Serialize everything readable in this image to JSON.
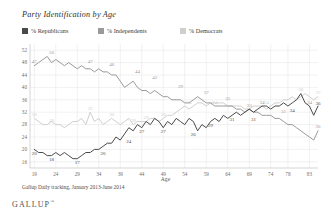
{
  "chart_data": {
    "type": "line",
    "title": "Party Identification by Age",
    "xlabel": "Age",
    "ylabel": "",
    "source_note": "Gallup Daily tracking, January 2013-June 2014",
    "brand": "GALLUP",
    "brand_mark": "™",
    "grid": true,
    "legend_position": "top",
    "xlim": [
      18,
      85
    ],
    "ylim": [
      14,
      54
    ],
    "yticks": [
      52,
      48,
      44,
      40,
      36,
      32,
      28,
      24,
      20,
      16
    ],
    "xticks": [
      19,
      24,
      29,
      34,
      39,
      44,
      49,
      54,
      59,
      64,
      69,
      74,
      78,
      83
    ],
    "colors": {
      "republicans": "#4a4a4a",
      "independents": "#9a9a9a",
      "democrats": "#cfcfcf",
      "grid": "#e2e2e2",
      "axis": "#b8b8b8"
    },
    "series": [
      {
        "name": "% Republicans",
        "color": "#4a4a4a",
        "x": [
          19,
          20,
          21,
          22,
          23,
          24,
          25,
          26,
          27,
          28,
          29,
          30,
          31,
          32,
          33,
          34,
          35,
          36,
          37,
          38,
          39,
          40,
          41,
          42,
          43,
          44,
          45,
          46,
          47,
          48,
          49,
          50,
          51,
          52,
          53,
          54,
          55,
          56,
          57,
          58,
          59,
          60,
          61,
          62,
          63,
          64,
          65,
          66,
          67,
          68,
          69,
          70,
          71,
          72,
          73,
          74,
          75,
          76,
          77,
          78,
          79,
          80,
          81,
          82,
          83,
          84,
          85
        ],
        "values": [
          20,
          19,
          19,
          18,
          18,
          19,
          18,
          19,
          18,
          17,
          17,
          18,
          19,
          19,
          20,
          20,
          21,
          22,
          22,
          24,
          23,
          25,
          27,
          26,
          28,
          27,
          29,
          28,
          30,
          29,
          27,
          29,
          28,
          30,
          29,
          28,
          30,
          29,
          26,
          28,
          27,
          29,
          30,
          29,
          31,
          30,
          31,
          32,
          31,
          32,
          33,
          32,
          33,
          34,
          34,
          33,
          34,
          34,
          35,
          34,
          35,
          36,
          38,
          35,
          34,
          31,
          34
        ]
      },
      {
        "name": "% Independents",
        "color": "#9a9a9a",
        "x": [
          19,
          20,
          21,
          22,
          23,
          24,
          25,
          26,
          27,
          28,
          29,
          30,
          31,
          32,
          33,
          34,
          35,
          36,
          37,
          38,
          39,
          40,
          41,
          42,
          43,
          44,
          45,
          46,
          47,
          48,
          49,
          50,
          51,
          52,
          53,
          54,
          55,
          56,
          57,
          58,
          59,
          60,
          61,
          62,
          63,
          64,
          65,
          66,
          67,
          68,
          69,
          70,
          71,
          72,
          73,
          74,
          75,
          76,
          77,
          78,
          79,
          80,
          81,
          82,
          83,
          84,
          85
        ],
        "values": [
          47,
          48,
          49,
          50,
          48,
          49,
          48,
          47,
          48,
          47,
          46,
          47,
          46,
          46,
          45,
          46,
          45,
          45,
          44,
          44,
          42,
          40,
          41,
          42,
          40,
          39,
          39,
          38,
          39,
          38,
          37,
          37,
          36,
          36,
          36,
          35,
          35,
          36,
          37,
          36,
          35,
          35,
          34,
          34,
          34,
          34,
          34,
          33,
          33,
          32,
          33,
          32,
          32,
          31,
          31,
          31,
          30,
          30,
          29,
          28,
          28,
          27,
          26,
          25,
          24,
          23,
          26
        ]
      },
      {
        "name": "% Democrats",
        "color": "#cfcfcf",
        "x": [
          19,
          20,
          21,
          22,
          23,
          24,
          25,
          26,
          27,
          28,
          29,
          30,
          31,
          32,
          33,
          34,
          35,
          36,
          37,
          38,
          39,
          40,
          41,
          42,
          43,
          44,
          45,
          46,
          47,
          48,
          49,
          50,
          51,
          52,
          53,
          54,
          55,
          56,
          57,
          58,
          59,
          60,
          61,
          62,
          63,
          64,
          65,
          66,
          67,
          68,
          69,
          70,
          71,
          72,
          73,
          74,
          75,
          76,
          77,
          78,
          79,
          80,
          81,
          82,
          83,
          84,
          85
        ],
        "values": [
          30,
          29,
          28,
          28,
          29,
          28,
          28,
          27,
          28,
          29,
          29,
          30,
          28,
          32,
          29,
          30,
          28,
          29,
          30,
          29,
          28,
          29,
          30,
          28,
          29,
          29,
          29,
          30,
          30,
          29,
          30,
          31,
          31,
          32,
          33,
          34,
          33,
          34,
          35,
          35,
          34,
          35,
          35,
          35,
          35,
          34,
          34,
          34,
          34,
          33,
          33,
          34,
          34,
          34,
          33,
          34,
          35,
          35,
          36,
          36,
          37,
          36,
          37,
          38,
          37,
          36,
          37
        ]
      }
    ],
    "annotations": [
      {
        "series": "independents",
        "x": 19,
        "y": 47,
        "text": "47"
      },
      {
        "series": "independents",
        "x": 23,
        "y": 50,
        "text": "50"
      },
      {
        "series": "independents",
        "x": 32,
        "y": 47,
        "text": "47"
      },
      {
        "series": "independents",
        "x": 37,
        "y": 46,
        "text": "46"
      },
      {
        "series": "independents",
        "x": 43,
        "y": 44,
        "text": "44"
      },
      {
        "series": "independents",
        "x": 47,
        "y": 42,
        "text": "42"
      },
      {
        "series": "independents",
        "x": 53,
        "y": 39,
        "text": "39"
      },
      {
        "series": "independents",
        "x": 59,
        "y": 37,
        "text": "37"
      },
      {
        "series": "independents",
        "x": 64,
        "y": 35,
        "text": "35"
      },
      {
        "series": "independents",
        "x": 69,
        "y": 33,
        "text": "33"
      },
      {
        "series": "independents",
        "x": 72,
        "y": 34,
        "text": "34"
      },
      {
        "series": "independents",
        "x": 77,
        "y": 31,
        "text": "31"
      },
      {
        "series": "independents",
        "x": 83,
        "y": 34,
        "text": "34"
      },
      {
        "series": "independents",
        "x": 85,
        "y": 26,
        "text": "26"
      },
      {
        "series": "democrats",
        "x": 19,
        "y": 30,
        "text": "30"
      },
      {
        "series": "democrats",
        "x": 23,
        "y": 28,
        "text": "28"
      },
      {
        "series": "democrats",
        "x": 32,
        "y": 32,
        "text": "32"
      },
      {
        "series": "democrats",
        "x": 37,
        "y": 30,
        "text": "30"
      },
      {
        "series": "democrats",
        "x": 42,
        "y": 28,
        "text": "28"
      },
      {
        "series": "democrats",
        "x": 45,
        "y": 29,
        "text": "29"
      },
      {
        "series": "democrats",
        "x": 49,
        "y": 30,
        "text": "30"
      },
      {
        "series": "democrats",
        "x": 55,
        "y": 34,
        "text": "34"
      },
      {
        "series": "democrats",
        "x": 61,
        "y": 34,
        "text": "34"
      },
      {
        "series": "democrats",
        "x": 73,
        "y": 34,
        "text": "34"
      },
      {
        "series": "democrats",
        "x": 81,
        "y": 38,
        "text": "38"
      },
      {
        "series": "democrats",
        "x": 85,
        "y": 37,
        "text": "37"
      },
      {
        "series": "republicans",
        "x": 19,
        "y": 20,
        "text": "20"
      },
      {
        "series": "republicans",
        "x": 23,
        "y": 18,
        "text": "18"
      },
      {
        "series": "republicans",
        "x": 29,
        "y": 17,
        "text": "17"
      },
      {
        "series": "republicans",
        "x": 35,
        "y": 20,
        "text": "20"
      },
      {
        "series": "republicans",
        "x": 41,
        "y": 24,
        "text": "24"
      },
      {
        "series": "republicans",
        "x": 44,
        "y": 27,
        "text": "27"
      },
      {
        "series": "republicans",
        "x": 49,
        "y": 27,
        "text": "27"
      },
      {
        "series": "republicans",
        "x": 56,
        "y": 26,
        "text": "26"
      },
      {
        "series": "republicans",
        "x": 60,
        "y": 29,
        "text": "29"
      },
      {
        "series": "republicans",
        "x": 65,
        "y": 31,
        "text": "31"
      },
      {
        "series": "republicans",
        "x": 70,
        "y": 31,
        "text": "31"
      },
      {
        "series": "republicans",
        "x": 79,
        "y": 34,
        "text": "34"
      },
      {
        "series": "republicans",
        "x": 85,
        "y": 36,
        "text": "36"
      }
    ]
  }
}
